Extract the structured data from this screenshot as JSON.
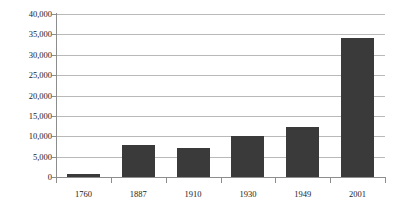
{
  "chart_data": {
    "type": "bar",
    "title": "",
    "xlabel": "",
    "ylabel": "",
    "categories": [
      "1760",
      "1887",
      "1910",
      "1930",
      "1949",
      "2001"
    ],
    "values": [
      750,
      7800,
      7000,
      10100,
      12200,
      34200
    ],
    "ylim": [
      0,
      40000
    ],
    "yticks": [
      0,
      5000,
      10000,
      15000,
      20000,
      25000,
      30000,
      35000,
      40000
    ],
    "ytick_labels": [
      "0",
      "5,000",
      "10,000",
      "15,000",
      "20,000",
      "25,000",
      "30,000",
      "35,000",
      "40,000"
    ],
    "grid": true,
    "legend": false,
    "bar_color": "#3a3a3a",
    "grid_color": "#b9b9b9",
    "axis_color": "#8d8d8d",
    "background_color": "#ffffff"
  }
}
